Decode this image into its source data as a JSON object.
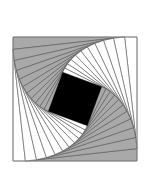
{
  "figure": {
    "outer_square": {
      "cx": 75,
      "cy": 99,
      "side": 124
    },
    "steps": 11,
    "division_ratio": 0.1,
    "colors": {
      "background": "#ffffff",
      "shaded": "#a9a9a9",
      "unshaded": "#ffffff",
      "stroke": "#555555",
      "border": "#888888",
      "center": "#000000"
    },
    "shaded_sides": [
      1,
      3
    ]
  }
}
